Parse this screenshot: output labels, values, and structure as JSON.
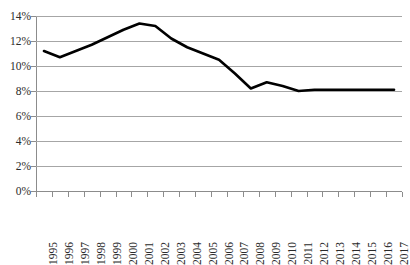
{
  "chart_data": {
    "type": "line",
    "title": "",
    "subtitle": "",
    "xlabel": "",
    "ylabel": "",
    "categories": [
      "1995",
      "1996",
      "1997",
      "1998",
      "1999",
      "2000",
      "2001",
      "2002",
      "2003",
      "2004",
      "2005",
      "2006",
      "2007",
      "2008",
      "2009",
      "2010",
      "2011",
      "2012",
      "2013",
      "2014",
      "2015",
      "2016",
      "2017"
    ],
    "series": [
      {
        "name": "",
        "values": [
          11.2,
          10.7,
          11.2,
          11.7,
          12.3,
          12.9,
          13.4,
          13.2,
          12.2,
          11.5,
          11.0,
          10.5,
          9.4,
          8.2,
          8.7,
          8.4,
          8.0,
          8.1,
          8.1,
          8.1,
          8.1,
          8.1,
          8.1
        ]
      }
    ],
    "ylim": [
      0,
      14
    ],
    "ytick_values": [
      0,
      2,
      4,
      6,
      8,
      10,
      12,
      14
    ],
    "ytick_labels": [
      "0%",
      "2%",
      "4%",
      "6%",
      "8%",
      "10%",
      "12%",
      "14%"
    ],
    "grid": "horizontal",
    "legend": "none",
    "line_color": "#000000",
    "gridline_color": "#a6a6a6",
    "axis_color": "#8c8c8c",
    "background_color": "#ffffff",
    "annotations": []
  }
}
